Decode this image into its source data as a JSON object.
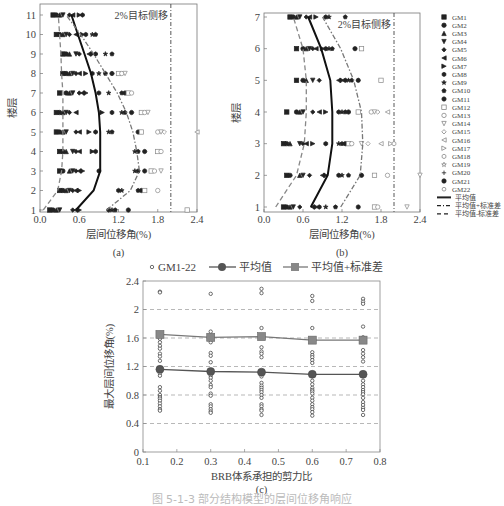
{
  "figure": {
    "caption": "图 5-1-3  部分结构模型的层间位移角响应",
    "panel_labels": [
      "(a)",
      "(b)",
      "(c)"
    ]
  },
  "legend_ab": {
    "items": [
      {
        "label": "GM1",
        "marker": "filled-square"
      },
      {
        "label": "GM2",
        "marker": "filled-circle"
      },
      {
        "label": "GM3",
        "marker": "filled-triangle-up"
      },
      {
        "label": "GM4",
        "marker": "filled-triangle-down"
      },
      {
        "label": "GM5",
        "marker": "filled-diamond"
      },
      {
        "label": "GM6",
        "marker": "filled-triangle-left"
      },
      {
        "label": "GM7",
        "marker": "filled-triangle-right"
      },
      {
        "label": "GM8",
        "marker": "filled-hexagon"
      },
      {
        "label": "GM9",
        "marker": "filled-star"
      },
      {
        "label": "GM10",
        "marker": "filled-pentagon"
      },
      {
        "label": "GM11",
        "marker": "filled-octagon"
      },
      {
        "label": "GM12",
        "marker": "open-square"
      },
      {
        "label": "GM13",
        "marker": "open-circle"
      },
      {
        "label": "GM14",
        "marker": "open-triangle-down"
      },
      {
        "label": "GM15",
        "marker": "open-diamond"
      },
      {
        "label": "GM16",
        "marker": "open-triangle-left"
      },
      {
        "label": "GM17",
        "marker": "open-triangle-right"
      },
      {
        "label": "GM18",
        "marker": "open-hexagon"
      },
      {
        "label": "GM19",
        "marker": "open-star"
      },
      {
        "label": "GM20",
        "marker": "plus"
      },
      {
        "label": "GM21",
        "marker": "asterisk-circle"
      },
      {
        "label": "GM22",
        "marker": "open-circle-small"
      },
      {
        "label": "平均值",
        "marker": "solid-line"
      },
      {
        "label": "平均值+标准差",
        "marker": "dash-dot-line"
      },
      {
        "label": "平均值-标准差",
        "marker": "dashed-line"
      }
    ]
  },
  "chart_data": [
    {
      "id": "a",
      "type": "scatter",
      "title": "",
      "annotation": "2%目标侧移",
      "xlabel": "层间位移角(%)",
      "ylabel": "楼层",
      "xlim": [
        0.0,
        2.4
      ],
      "ylim": [
        1,
        11
      ],
      "xticks": [
        "0.0",
        "0.6",
        "1.2",
        "1.8",
        "2.4"
      ],
      "yticks": [
        "1",
        "2",
        "3",
        "4",
        "5",
        "6",
        "7",
        "8",
        "9",
        "10",
        "11"
      ],
      "target_drift_line_x": 2.0,
      "grid": false,
      "series": [
        {
          "name": "平均值",
          "style": "solid",
          "stories": [
            1,
            2,
            3,
            4,
            5,
            6,
            7,
            8,
            9,
            10,
            11
          ],
          "values": [
            0.55,
            0.82,
            0.92,
            0.92,
            0.92,
            0.9,
            0.85,
            0.78,
            0.68,
            0.58,
            0.48
          ]
        },
        {
          "name": "平均值+标准差",
          "style": "dash-dot",
          "stories": [
            1,
            2,
            3,
            4,
            5,
            6,
            7,
            8,
            9,
            10,
            11
          ],
          "values": [
            1.02,
            1.38,
            1.52,
            1.48,
            1.42,
            1.32,
            1.18,
            1.0,
            0.82,
            0.62,
            0.4
          ]
        },
        {
          "name": "平均值-标准差",
          "style": "dashed",
          "stories": [
            1,
            2,
            3,
            4,
            5,
            6,
            7,
            8,
            9,
            10,
            11
          ],
          "values": [
            0.05,
            0.27,
            0.33,
            0.35,
            0.35,
            0.35,
            0.35,
            0.33,
            0.32,
            0.3,
            0.28
          ]
        },
        {
          "name": "GM1-22 scatter (approx x per story)",
          "points": {
            "1": [
              0.15,
              0.2,
              0.25,
              0.3,
              0.5,
              0.55,
              0.6,
              1.05,
              1.1,
              1.15,
              1.35,
              2.25
            ],
            "2": [
              0.3,
              0.35,
              0.4,
              0.45,
              0.5,
              0.55,
              0.6,
              1.2,
              1.25,
              1.5,
              1.55,
              1.6,
              1.8
            ],
            "3": [
              0.3,
              0.35,
              0.45,
              0.5,
              0.55,
              0.6,
              0.65,
              0.9,
              1.45,
              1.5,
              1.6,
              1.7,
              1.75,
              1.85
            ],
            "4": [
              0.3,
              0.35,
              0.4,
              0.5,
              0.55,
              0.6,
              0.8,
              0.85,
              1.45,
              1.5,
              1.6,
              1.8,
              1.85
            ],
            "5": [
              0.25,
              0.3,
              0.35,
              0.4,
              0.55,
              0.6,
              0.75,
              0.85,
              1.05,
              1.1,
              1.5,
              1.55,
              1.8,
              1.85,
              1.9,
              2.4
            ],
            "6": [
              0.25,
              0.3,
              0.35,
              0.4,
              0.45,
              0.55,
              0.95,
              1.1,
              1.25,
              1.3,
              1.4,
              1.55,
              1.6,
              1.65
            ],
            "7": [
              0.3,
              0.4,
              0.45,
              0.5,
              0.6,
              0.65,
              0.7,
              0.9,
              1.05,
              1.25,
              1.3,
              1.35,
              1.4
            ],
            "8": [
              0.35,
              0.4,
              0.45,
              0.5,
              0.55,
              0.6,
              0.7,
              0.8,
              0.9,
              1.0,
              1.1,
              1.2,
              1.25,
              1.3
            ],
            "9": [
              0.35,
              0.4,
              0.45,
              0.55,
              0.6,
              0.75,
              0.8,
              0.85,
              1.0,
              1.1
            ],
            "10": [
              0.25,
              0.3,
              0.35,
              0.4,
              0.45,
              0.55,
              0.65,
              0.7,
              0.8,
              0.85
            ],
            "11": [
              0.2,
              0.25,
              0.3,
              0.35,
              0.45,
              0.5,
              0.6,
              0.65
            ]
          }
        }
      ]
    },
    {
      "id": "b",
      "type": "scatter",
      "title": "",
      "annotation": "2%目标侧移",
      "xlabel": "层间位移角(%)",
      "ylabel": "楼层",
      "xlim": [
        0.0,
        2.4
      ],
      "ylim": [
        1,
        7
      ],
      "xticks": [
        "0.0",
        "0.6",
        "1.2",
        "1.8",
        "2.4"
      ],
      "yticks": [
        "1",
        "2",
        "3",
        "4",
        "5",
        "6",
        "7"
      ],
      "target_drift_line_x": 2.0,
      "grid": false,
      "series": [
        {
          "name": "平均值",
          "style": "solid",
          "stories": [
            1,
            2,
            3,
            4,
            5,
            6,
            7
          ],
          "values": [
            0.72,
            0.98,
            1.05,
            1.05,
            1.02,
            0.88,
            0.68
          ]
        },
        {
          "name": "平均值+标准差",
          "style": "dash-dot",
          "stories": [
            1,
            2,
            3,
            4,
            5,
            6,
            7
          ],
          "values": [
            1.18,
            1.48,
            1.52,
            1.5,
            1.38,
            1.18,
            0.9
          ]
        },
        {
          "name": "平均值-标准差",
          "style": "dashed",
          "stories": [
            1,
            2,
            3,
            4,
            5,
            6,
            7
          ],
          "values": [
            0.18,
            0.5,
            0.62,
            0.65,
            0.65,
            0.6,
            0.45
          ]
        },
        {
          "name": "GM1-22 scatter (approx x per story)",
          "points": {
            "1": [
              0.3,
              0.35,
              0.4,
              0.45,
              0.55,
              0.75,
              0.8,
              0.85,
              0.95,
              1.1,
              1.45,
              1.7,
              1.75,
              2.2
            ],
            "2": [
              0.35,
              0.4,
              0.55,
              0.6,
              0.7,
              0.9,
              0.95,
              1.15,
              1.2,
              1.3,
              1.5,
              1.7,
              1.9,
              2.4
            ],
            "3": [
              0.3,
              0.35,
              0.4,
              0.55,
              0.6,
              0.65,
              0.75,
              0.95,
              1.15,
              1.2,
              1.25,
              1.3,
              1.35,
              1.5,
              1.6,
              1.8,
              1.95,
              2.0
            ],
            "4": [
              0.35,
              0.5,
              0.55,
              0.6,
              0.75,
              0.85,
              0.95,
              1.15,
              1.2,
              1.25,
              1.3,
              1.45,
              1.65,
              1.7,
              1.75,
              1.9
            ],
            "5": [
              0.5,
              0.6,
              0.65,
              0.75,
              0.85,
              1.15,
              1.2,
              1.25,
              1.3,
              1.35,
              1.45,
              1.8
            ],
            "6": [
              0.5,
              0.6,
              0.65,
              0.7,
              0.75,
              0.8,
              0.9,
              0.95,
              1.0,
              1.05,
              1.4,
              1.5
            ],
            "7": [
              0.4,
              0.45,
              0.5,
              0.55,
              0.65,
              0.7,
              0.8,
              0.95,
              1.0,
              1.25
            ]
          }
        }
      ]
    },
    {
      "id": "c",
      "type": "scatter",
      "title": "",
      "xlabel": "BRB体系承担的剪力比",
      "ylabel": "最大层间位移角(%)",
      "xlim": [
        0.1,
        0.8
      ],
      "ylim": [
        0,
        2.4
      ],
      "xticks": [
        "0.1",
        "0.2",
        "0.3",
        "0.4",
        "0.5",
        "0.6",
        "0.7",
        "0.8"
      ],
      "yticks": [
        "0",
        "0.4",
        "0.8",
        "1.2",
        "1.6",
        "2",
        "2.4"
      ],
      "grid": "horizontal dashed at 0.4,0.8,1.2,1.6,2.0",
      "legend": [
        "GM1-22",
        "平均值",
        "平均值+标准差"
      ],
      "legend_position": "top",
      "categories": [
        0.15,
        0.3,
        0.45,
        0.6,
        0.75
      ],
      "series": [
        {
          "name": "平均值",
          "values": [
            1.16,
            1.13,
            1.12,
            1.09,
            1.09
          ]
        },
        {
          "name": "平均值+标准差",
          "values": [
            1.65,
            1.61,
            1.62,
            1.57,
            1.57
          ]
        },
        {
          "name": "GM1-22",
          "points": {
            "0.15": [
              2.25,
              2.24,
              1.67,
              1.65,
              1.59,
              1.54,
              1.49,
              1.45,
              1.38,
              1.34,
              1.28,
              1.18,
              1.16,
              1.1,
              1.07,
              0.91,
              0.86,
              0.8,
              0.77,
              0.75,
              0.72,
              0.68,
              0.64,
              0.6,
              0.58
            ],
            "0.30": [
              2.22,
              1.69,
              1.62,
              1.58,
              1.54,
              1.39,
              1.35,
              1.26,
              1.14,
              1.1,
              1.07,
              1.04,
              1.0,
              0.94,
              0.91,
              0.82,
              0.79,
              0.67,
              0.64,
              0.6,
              0.57,
              0.55
            ],
            "0.45": [
              2.29,
              2.23,
              1.74,
              1.62,
              1.47,
              1.41,
              1.38,
              1.33,
              1.11,
              1.06,
              0.97,
              0.93,
              0.9,
              0.87,
              0.84,
              0.8,
              0.76,
              0.67,
              0.64,
              0.6,
              0.58,
              0.52
            ],
            "0.60": [
              2.19,
              2.12,
              1.74,
              1.58,
              1.4,
              1.36,
              1.33,
              1.29,
              1.25,
              1.09,
              1.0,
              0.95,
              0.9,
              0.87,
              0.85,
              0.82,
              0.76,
              0.72,
              0.67,
              0.63,
              0.6,
              0.56,
              0.51
            ],
            "0.75": [
              2.15,
              2.11,
              2.08,
              1.76,
              1.61,
              1.58,
              1.43,
              1.38,
              1.33,
              1.27,
              1.09,
              1.0,
              0.95,
              0.91,
              0.87,
              0.84,
              0.81,
              0.76,
              0.7,
              0.66,
              0.62,
              0.59,
              0.52
            ]
          }
        }
      ]
    }
  ]
}
